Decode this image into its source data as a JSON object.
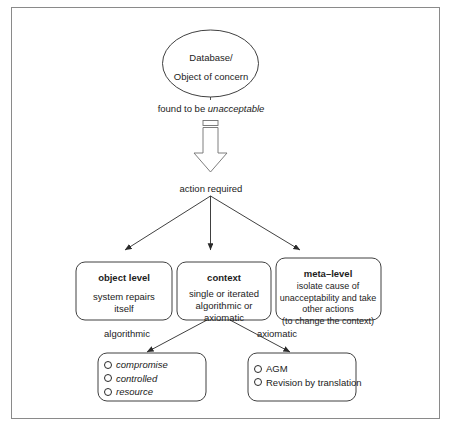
{
  "figure": {
    "type": "flowchart",
    "frame": {
      "border_color": "#8a8a8a"
    },
    "background": "#ffffff",
    "stroke_color": "#2a2a2a"
  },
  "start_node": {
    "shape": "ellipse",
    "line1": "Database/",
    "line2": "Object of concern"
  },
  "edges": {
    "found_to_be": "found to be ",
    "found_to_be_emphasis": "unacceptable",
    "action_required": "action required",
    "algorithmic": "algorithmic",
    "axiomatic": "axiomatic"
  },
  "levels": [
    {
      "id": "object-level",
      "title": "object level",
      "body_line1": "system repairs",
      "body_line2": "itself"
    },
    {
      "id": "context",
      "title": "context",
      "body_line1": "single or iterated",
      "body_line2": "algorithmic or",
      "body_line3": "axiomatic"
    },
    {
      "id": "meta-level",
      "title": "meta–level",
      "body_line1": "isolate cause of",
      "body_line2": "unacceptability and take",
      "body_line3": "other actions",
      "body_line4": "(to change the context)"
    }
  ],
  "leaf_lists": [
    {
      "id": "algorithmic-methods",
      "italic": true,
      "items": [
        "compromise",
        "controlled",
        "resource"
      ]
    },
    {
      "id": "axiomatic-methods",
      "italic": false,
      "items": [
        "AGM",
        "Revision by translation"
      ]
    }
  ]
}
